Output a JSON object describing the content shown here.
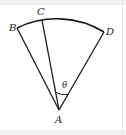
{
  "diagram": {
    "type": "circular sector with radii",
    "points": {
      "A": {
        "label": "A",
        "x": 59,
        "y": 110
      },
      "B": {
        "label": "B",
        "x": 17,
        "y": 28
      },
      "C": {
        "label": "C",
        "x": 42,
        "y": 20
      },
      "D": {
        "label": "D",
        "x": 104,
        "y": 32
      }
    },
    "segments": [
      "AB",
      "AC",
      "AD"
    ],
    "arc": {
      "from": "B",
      "to": "D",
      "center": "A",
      "radius": 91
    },
    "angle": {
      "label": "θ",
      "between": [
        "AC",
        "AD"
      ],
      "vertex": "A"
    },
    "colors": {
      "stroke": "#1a1a1a",
      "text": "#222222",
      "frame": "#f1f1f1"
    }
  }
}
